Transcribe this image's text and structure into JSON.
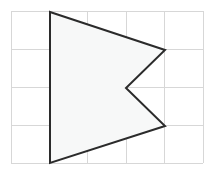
{
  "figure": {
    "canvas": {
      "width": 212,
      "height": 171,
      "background": "#ffffff"
    },
    "grid": {
      "label": "square grid",
      "columns": 5,
      "rows": 4,
      "cell_width": 38.4,
      "cell_height": 38,
      "x_lines": [
        11,
        49.4,
        87.8,
        126.2,
        164.6,
        203
      ],
      "y_lines": [
        11,
        49,
        87,
        125,
        163
      ],
      "line_color": "#d7d7d7",
      "line_width": 1,
      "origin": {
        "x": 11,
        "y": 11
      },
      "extent": {
        "x": 203,
        "y": 163
      }
    },
    "polygon": {
      "label": "arrowhead polygon",
      "vertex_count": 5,
      "points_px": [
        {
          "name": "top-left-apex",
          "x": 50,
          "y": 12
        },
        {
          "name": "upper-right-point",
          "x": 165,
          "y": 50
        },
        {
          "name": "notch-vertex",
          "x": 126,
          "y": 88
        },
        {
          "name": "lower-right-point",
          "x": 165,
          "y": 126
        },
        {
          "name": "bottom-left-apex",
          "x": 50,
          "y": 163
        }
      ],
      "points_attr": "50,12 165,50 126,88 165,126 50,163",
      "grid_coordinates": [
        {
          "col": 1,
          "row": 0
        },
        {
          "col": 4,
          "row": 1
        },
        {
          "col": 3,
          "row": 2
        },
        {
          "col": 4,
          "row": 3
        },
        {
          "col": 1,
          "row": 4
        }
      ],
      "stroke_color": "#2b2b2b",
      "stroke_width": 2,
      "fill_color": "#f7f8f8",
      "closed": true,
      "concave": true
    }
  }
}
